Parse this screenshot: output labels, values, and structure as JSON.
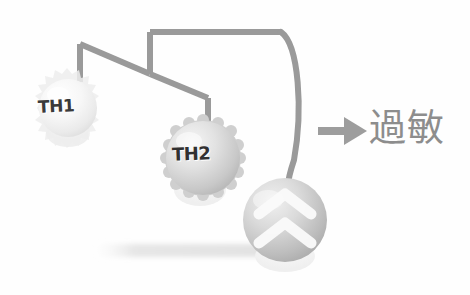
{
  "figure": {
    "background_color": "#fefefe",
    "line_color": "#9a9a9a",
    "arrow_color": "#9d9d9d",
    "text_color": "#8d8d8d"
  },
  "cells": [
    {
      "id": "th1",
      "label": "TH1",
      "cx": 68,
      "cy": 108,
      "r": 30,
      "fill_light": "#fdfdfd",
      "fill_dark": "#e2e2e2",
      "rim": "spiky"
    },
    {
      "id": "th2",
      "label": "TH2",
      "cx": 203,
      "cy": 158,
      "r": 38,
      "fill_light": "#efefef",
      "fill_dark": "#bdbdbd",
      "rim": "bumpy"
    },
    {
      "id": "effector",
      "label": "",
      "cx": 285,
      "cy": 220,
      "r": 42,
      "fill_light": "#eaeaea",
      "fill_dark": "#b4b4b4",
      "rim": "smooth",
      "marking": "double-chevron"
    }
  ],
  "arrow": {
    "name": "allergy-arrow",
    "x1": 318,
    "y1": 131,
    "x2": 364,
    "y2": 131
  },
  "outcome": {
    "text": "過敏",
    "meaning_icon": "allergy-label"
  },
  "ground": {
    "shadow_color": "#e8e8e8"
  }
}
